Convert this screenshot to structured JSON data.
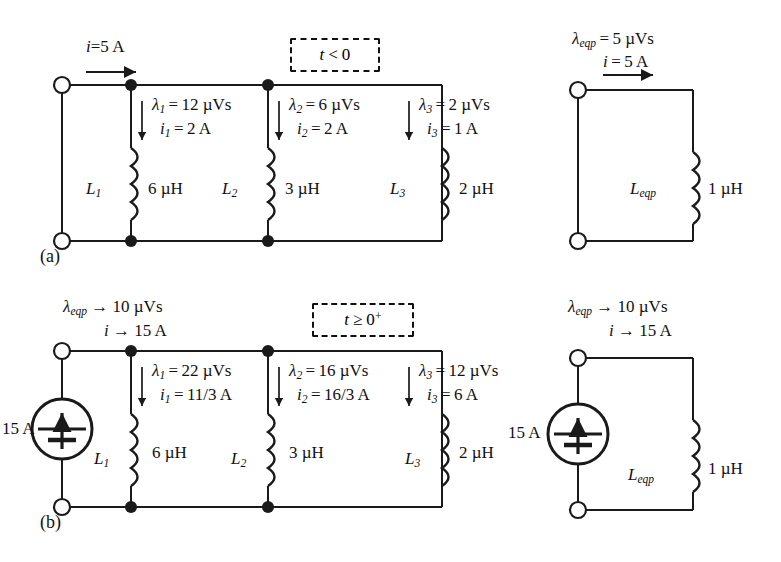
{
  "figure": {
    "panels": [
      {
        "tag": "(a)",
        "condition": "t < 0"
      },
      {
        "tag": "(b)",
        "condition": "t ≥ 0⁺"
      }
    ]
  },
  "panel_a": {
    "tag": "(a)",
    "condition_box": "t < 0",
    "source_current": {
      "symbol": "i",
      "relation": "=",
      "value": "5 A"
    },
    "branches": [
      {
        "name": "L1",
        "inductor_label": "L",
        "inductor_sub": "1",
        "inductance": "6 µH",
        "flux_label": "λ",
        "flux_sub": "1",
        "flux_relation": "=",
        "flux_value": "12 µVs",
        "current_label": "i",
        "current_sub": "1",
        "current_relation": "=",
        "current_value": "2 A"
      },
      {
        "name": "L2",
        "inductor_label": "L",
        "inductor_sub": "2",
        "inductance": "3 µH",
        "flux_label": "λ",
        "flux_sub": "2",
        "flux_relation": "=",
        "flux_value": "6 µVs",
        "current_label": "i",
        "current_sub": "2",
        "current_relation": "=",
        "current_value": "2 A"
      },
      {
        "name": "L3",
        "inductor_label": "L",
        "inductor_sub": "3",
        "inductance": "2 µH",
        "flux_label": "λ",
        "flux_sub": "3",
        "flux_relation": "=",
        "flux_value": "2 µVs",
        "current_label": "i",
        "current_sub": "3",
        "current_relation": "=",
        "current_value": "1 A"
      }
    ],
    "equivalent": {
      "flux_label": "λ",
      "flux_sub": "eqp",
      "flux_relation": "=",
      "flux_value": "5 µVs",
      "current_label": "i",
      "current_relation": "=",
      "current_value": "5 A",
      "inductor_label": "L",
      "inductor_sub": "eqp",
      "inductance": "1 µH"
    }
  },
  "panel_b": {
    "tag": "(b)",
    "condition_box": "t ≥ 0⁺",
    "terminal_flux": {
      "label": "λ",
      "sub": "eqp",
      "relation": "→",
      "value": "10 µVs"
    },
    "terminal_current": {
      "label": "i",
      "relation": "→",
      "value": "15 A"
    },
    "source": {
      "value": "15 A",
      "type": "dc-current-source"
    },
    "branches": [
      {
        "name": "L1",
        "inductor_label": "L",
        "inductor_sub": "1",
        "inductance": "6 µH",
        "flux_label": "λ",
        "flux_sub": "1",
        "flux_relation": "=",
        "flux_value": "22 µVs",
        "current_label": "i",
        "current_sub": "1",
        "current_relation": "=",
        "current_value": "11/3 A"
      },
      {
        "name": "L2",
        "inductor_label": "L",
        "inductor_sub": "2",
        "inductance": "3 µH",
        "flux_label": "λ",
        "flux_sub": "2",
        "flux_relation": "=",
        "flux_value": "16 µVs",
        "current_label": "i",
        "current_sub": "2",
        "current_relation": "=",
        "current_value": "16/3 A"
      },
      {
        "name": "L3",
        "inductor_label": "L",
        "inductor_sub": "3",
        "inductance": "2 µH",
        "flux_label": "λ",
        "flux_sub": "3",
        "flux_relation": "=",
        "flux_value": "12 µVs",
        "current_label": "i",
        "current_sub": "3",
        "current_relation": "=",
        "current_value": "6 A"
      }
    ],
    "equivalent": {
      "flux_label": "λ",
      "flux_sub": "eqp",
      "flux_relation": "→",
      "flux_value": "10 µVs",
      "current_label": "i",
      "current_relation": "→",
      "current_value": "15 A",
      "source_value": "15 A",
      "inductor_label": "L",
      "inductor_sub": "eqp",
      "inductance": "1 µH"
    }
  },
  "colors": {
    "wire": "#1a1a1a",
    "text": "#111111",
    "background": "#ffffff"
  }
}
